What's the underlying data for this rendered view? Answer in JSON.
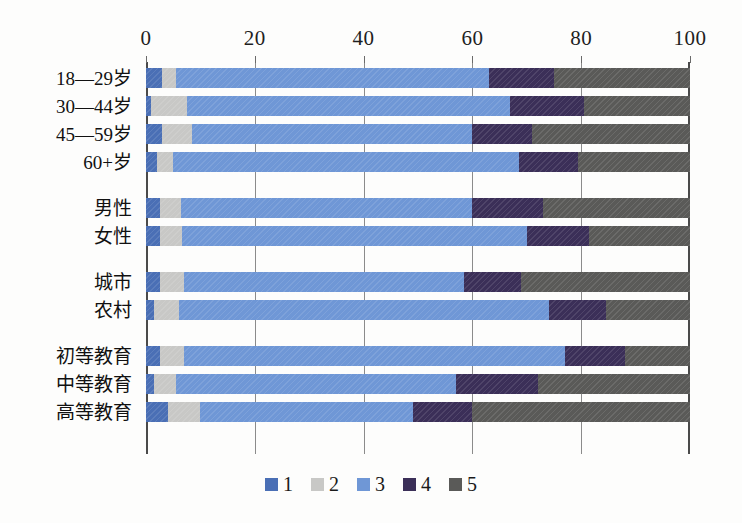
{
  "chart_data": {
    "type": "bar",
    "orientation": "horizontal",
    "stacked": true,
    "title": "",
    "subtitle": "",
    "xlabel": "",
    "ylabel": "",
    "xlim": [
      0,
      100
    ],
    "xticks": [
      0,
      20,
      40,
      60,
      80,
      100
    ],
    "xtick_labels": [
      "0",
      "20",
      "40",
      "60",
      "80",
      "100"
    ],
    "grid": true,
    "legend_position": "bottom",
    "categories": [
      "18—29岁",
      "30—44岁",
      "45—59岁",
      "60+岁",
      "男性",
      "女性",
      "城市",
      "农村",
      "初等教育",
      "中等教育",
      "高等教育"
    ],
    "category_groups": [
      {
        "name": "age",
        "categories": [
          "18—29岁",
          "30—44岁",
          "45—59岁",
          "60+岁"
        ]
      },
      {
        "name": "gender",
        "categories": [
          "男性",
          "女性"
        ]
      },
      {
        "name": "residence",
        "categories": [
          "城市",
          "农村"
        ]
      },
      {
        "name": "education",
        "categories": [
          "初等教育",
          "中等教育",
          "高等教育"
        ]
      }
    ],
    "series": [
      {
        "name": "1",
        "color": "#4a6fb5",
        "values": [
          3.0,
          1.0,
          3.0,
          2.0,
          2.5,
          2.5,
          2.5,
          1.5,
          2.5,
          1.5,
          4.0
        ]
      },
      {
        "name": "2",
        "color": "#c8c8c6",
        "values": [
          2.5,
          6.5,
          5.5,
          3.0,
          4.0,
          4.2,
          4.5,
          4.5,
          4.5,
          4.0,
          6.0
        ]
      },
      {
        "name": "3",
        "color": "#6f97d6",
        "values": [
          57.5,
          59.5,
          51.5,
          63.5,
          53.5,
          63.3,
          51.5,
          68.0,
          70.0,
          51.5,
          39.0
        ]
      },
      {
        "name": "4",
        "color": "#3b2f58",
        "values": [
          12.0,
          13.5,
          11.0,
          11.0,
          13.0,
          11.5,
          10.5,
          10.5,
          11.0,
          15.0,
          11.0
        ]
      },
      {
        "name": "5",
        "color": "#5a5a58",
        "values": [
          25.0,
          19.5,
          29.0,
          20.5,
          27.0,
          18.5,
          31.0,
          15.5,
          12.0,
          28.0,
          40.0
        ]
      }
    ],
    "legend_entries": [
      {
        "label": "1",
        "color": "#4a6fb5"
      },
      {
        "label": "2",
        "color": "#c8c8c6"
      },
      {
        "label": "3",
        "color": "#6f97d6"
      },
      {
        "label": "4",
        "color": "#3b2f58"
      },
      {
        "label": "5",
        "color": "#5a5a58"
      }
    ]
  },
  "colors": {
    "series_1": "#4a6fb5",
    "series_2": "#c8c8c6",
    "series_3": "#6f97d6",
    "series_4": "#3b2f58",
    "series_5": "#5a5a58",
    "axis": "#4a4a4a",
    "gridline": "#8b8b8b",
    "background": "#fdfdfc",
    "text": "#1a1a1a"
  }
}
